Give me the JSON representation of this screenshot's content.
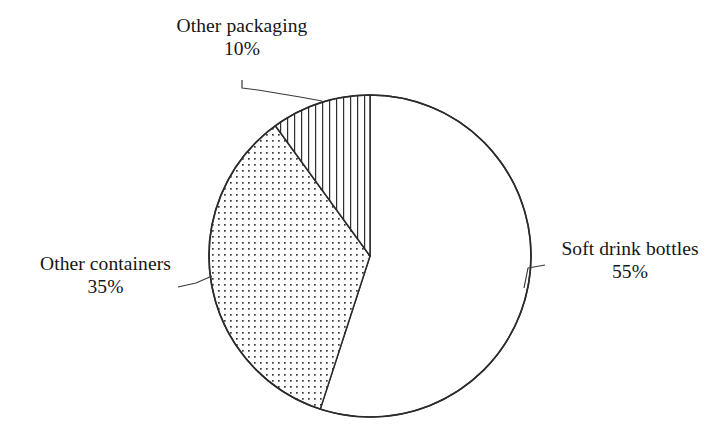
{
  "figure": {
    "name": "recycled-pet-end-use-pie",
    "background_color": "#ffffff",
    "line_color": "#2b2b2b",
    "text_color": "#151515"
  },
  "chart_data": {
    "type": "pie",
    "title": "",
    "subtitle": "",
    "xlabel": "",
    "ylabel": "",
    "legend_position": "none",
    "grid": false,
    "units": "%",
    "total": 100,
    "start_angle_deg": 0,
    "direction": "clockwise",
    "categories": [
      "Soft drink bottles",
      "Other containers",
      "Other packaging"
    ],
    "values": [
      55,
      35,
      10
    ],
    "labels": [
      "55%",
      "35%",
      "10%"
    ],
    "slices": [
      {
        "name": "Soft drink bottles",
        "value": 55,
        "value_label": "55%",
        "fill": "white",
        "pattern": "none",
        "start_deg": 0,
        "end_deg": 198
      },
      {
        "name": "Other containers",
        "value": 35,
        "value_label": "35%",
        "fill": "dotted",
        "pattern": "dots",
        "start_deg": 198,
        "end_deg": 324
      },
      {
        "name": "Other packaging",
        "value": 10,
        "value_label": "10%",
        "fill": "hatched",
        "pattern": "vertical-lines",
        "start_deg": 324,
        "end_deg": 360
      }
    ],
    "annotations": [
      {
        "target": "Other packaging",
        "text": "Other packaging 10%",
        "position": "top-left",
        "leader_line": true
      },
      {
        "target": "Other containers",
        "text": "Other containers 35%",
        "position": "left",
        "leader_line": true
      },
      {
        "target": "Soft drink bottles",
        "text": "Soft drink bottles 55%",
        "position": "right",
        "leader_line": true
      }
    ]
  },
  "labels": {
    "packaging": {
      "name": "Other packaging",
      "value": "10%"
    },
    "containers": {
      "name": "Other containers",
      "value": "35%"
    },
    "bottles": {
      "name": "Soft drink bottles",
      "value": "55%"
    }
  },
  "ghost_text": {
    "line1": "",
    "line2": "",
    "line3": "",
    "line4": "",
    "line5": "",
    "line6": ""
  }
}
